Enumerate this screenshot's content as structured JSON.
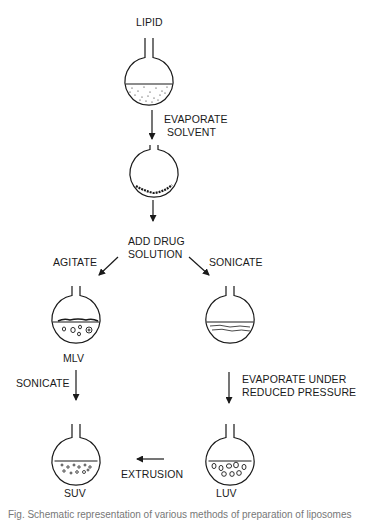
{
  "diagram": {
    "labels": {
      "lipid": "LIPID",
      "evaporate_solvent_1": "EVAPORATE",
      "evaporate_solvent_2": "SOLVENT",
      "add_drug_1": "ADD DRUG",
      "add_drug_2": "SOLUTION",
      "agitate": "AGITATE",
      "sonicate_right": "SONICATE",
      "mlv": "MLV",
      "sonicate_left": "SONICATE",
      "evap_reduced_1": "EVAPORATE UNDER",
      "evap_reduced_2": "REDUCED PRESSURE",
      "extrusion": "EXTRUSION",
      "suv": "SUV",
      "luv": "LUV"
    },
    "nodes": [
      {
        "id": "lipid-flask",
        "label": "LIPID",
        "content": "lipid in solvent (dotted)"
      },
      {
        "id": "film-flask",
        "label": "",
        "content": "dry lipid film"
      },
      {
        "id": "mlv-flask",
        "label": "MLV",
        "content": "multilamellar vesicles"
      },
      {
        "id": "emulsion-flask",
        "label": "",
        "content": "emulsion layer"
      },
      {
        "id": "suv-flask",
        "label": "SUV",
        "content": "small unilamellar vesicles"
      },
      {
        "id": "luv-flask",
        "label": "LUV",
        "content": "large unilamellar vesicles"
      }
    ],
    "edges": [
      {
        "from": "lipid-flask",
        "to": "film-flask",
        "label": "EVAPORATE SOLVENT"
      },
      {
        "from": "film-flask",
        "to": "add-drug",
        "label": ""
      },
      {
        "from": "add-drug",
        "to": "mlv-flask",
        "label": "AGITATE"
      },
      {
        "from": "add-drug",
        "to": "emulsion-flask",
        "label": "SONICATE"
      },
      {
        "from": "mlv-flask",
        "to": "suv-flask",
        "label": "SONICATE"
      },
      {
        "from": "emulsion-flask",
        "to": "luv-flask",
        "label": "EVAPORATE UNDER REDUCED PRESSURE"
      },
      {
        "from": "luv-flask",
        "to": "suv-flask",
        "label": "EXTRUSION"
      }
    ],
    "caption_fragment": "Fig. Schematic representation of various methods of preparation of liposomes"
  }
}
